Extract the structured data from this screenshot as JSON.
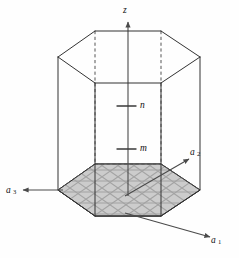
{
  "figure": {
    "background_color": "#fefefe",
    "edge_color": "#333333",
    "hidden_edge_color": "#555555",
    "base_fill_color": "#c9c9c9",
    "hatch_color": "#1f1f1f",
    "axis_color": "#4a4a4a"
  },
  "axes": {
    "vertical": {
      "name": "z-axis",
      "label": "z",
      "direction": "up",
      "label_x": 124,
      "label_y": 11
    },
    "a1": {
      "name": "a1-axis",
      "label": "a",
      "subscript": "1",
      "direction": "down-right",
      "label_x": 220,
      "label_y": 240,
      "from_x": 125,
      "from_y": 213,
      "to_x": 212,
      "to_y": 238
    },
    "a2": {
      "name": "a2-axis",
      "label": "a",
      "subscript": "2",
      "direction": "up-right",
      "label_x": 198,
      "label_y": 152,
      "from_x": 125,
      "from_y": 196,
      "to_x": 190,
      "to_y": 158
    },
    "a3": {
      "name": "a3-axis",
      "label": "a",
      "subscript": "3",
      "direction": "left",
      "label_x": 10,
      "label_y": 193,
      "from_x": 63,
      "from_y": 190,
      "to_x": 20,
      "to_y": 190
    }
  },
  "markers": [
    {
      "name": "marker-n",
      "label": "n",
      "label_x": 141,
      "label_y": 106,
      "tick_x1": 117,
      "tick_x2": 135,
      "tick_y": 106
    },
    {
      "name": "marker-m",
      "label": "m",
      "label_x": 141,
      "label_y": 149,
      "tick_x1": 117,
      "tick_x2": 135,
      "tick_y": 149
    }
  ],
  "geometry": {
    "description": "Hexagonal prism drawn in oblique projection. Top hexagon and bottom hexagon connected by six vertical edges; bottom face is shaded and cross-hatched with a rhombic lattice grid.",
    "top_hexagon_points": "58,57 95,31 161,31 200,57 161,83 95,83",
    "bottom_hexagon_points": "58,190 95,164 161,164 200,190 161,216 95,216",
    "vertical_edges": [
      {
        "x": 58,
        "y1": 57,
        "y2": 190,
        "visible": true
      },
      {
        "x": 95,
        "y1": 31,
        "y2": 164,
        "visible": false
      },
      {
        "x": 161,
        "y1": 31,
        "y2": 164,
        "visible": false
      },
      {
        "x": 200,
        "y1": 57,
        "y2": 190,
        "visible": true
      },
      {
        "x": 161,
        "y1": 83,
        "y2": 216,
        "visible": true
      },
      {
        "x": 95,
        "y1": 83,
        "y2": 216,
        "visible": true
      }
    ],
    "base_shaded": true,
    "hatch_pattern": "rhombic-grid"
  },
  "labels": {
    "z": "z",
    "n": "n",
    "m": "m",
    "a_base": "a",
    "a1_sub": "1",
    "a2_sub": "2",
    "a3_sub": "3"
  }
}
